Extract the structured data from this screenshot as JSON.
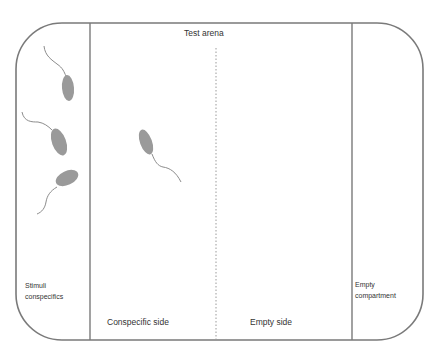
{
  "diagram": {
    "title": "Test arena",
    "compartments": [
      {
        "id": "stimuli",
        "label_line1": "Stimuli",
        "label_line2": "conspecifics"
      },
      {
        "id": "conspecific-side",
        "label": "Conspecific side"
      },
      {
        "id": "empty-side",
        "label": "Empty side"
      },
      {
        "id": "empty-compartment",
        "label_line1": "Empty",
        "label_line2": "compartment"
      }
    ],
    "fish": [
      {
        "compartment": "stimuli",
        "count": 3
      },
      {
        "compartment": "conspecific-side",
        "count": 1
      }
    ],
    "colors": {
      "outline": "#7a7a7a",
      "fish_body": "#9a9a9a",
      "fish_tail": "#8c8c8c",
      "divider": "#9a9a9a",
      "text": "#333333"
    }
  }
}
